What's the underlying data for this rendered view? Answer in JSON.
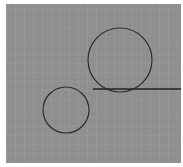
{
  "canvas": {
    "background": "#8f8f8f",
    "grid": true
  },
  "shapes": {
    "large_circle": {
      "cx": 120,
      "cy": 60,
      "r": 32,
      "stroke": "#2b2b2b"
    },
    "small_circle": {
      "cx": 66,
      "cy": 110,
      "r": 23,
      "stroke": "#2b2b2b"
    },
    "horizontal_line": {
      "x1": 93,
      "y1": 89,
      "x2": 181,
      "y2": 89,
      "stroke": "#222222"
    }
  }
}
